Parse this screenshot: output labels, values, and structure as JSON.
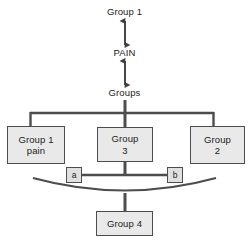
{
  "diagram": {
    "type": "hierarchy-flow-diagram",
    "colors": {
      "background": "#ffffff",
      "box_fill": "#e9e9e9",
      "small_box_fill": "#e0e0e0",
      "border": "#4d4d4d",
      "line": "#4d4d4d",
      "text": "#1b1b1b"
    },
    "top_chain": [
      {
        "id": "group-1",
        "label": "Group 1"
      },
      {
        "id": "pain",
        "label": "PAIN"
      },
      {
        "id": "groups",
        "label": "Groups"
      }
    ],
    "connectors": {
      "group1_to_pain": "double-headed-vertical-arrow",
      "pain_to_groups": "double-headed-vertical-arrow",
      "groups_to_branch": "vertical-line",
      "branch": "horizontal-bracket-three-way",
      "group3_to_ab": "vertical-line",
      "a_to_b": "horizontal-line",
      "arc_to_group4": "downward-arc",
      "arc_to_group4_stem": "vertical-line"
    },
    "branch_boxes": [
      {
        "id": "group-1-pain",
        "label": "Group 1\npain"
      },
      {
        "id": "group-3",
        "label": "Group\n3"
      },
      {
        "id": "group-2",
        "label": "Group\n2"
      }
    ],
    "marker_boxes": [
      {
        "id": "marker-a",
        "label": "a"
      },
      {
        "id": "marker-b",
        "label": "b"
      }
    ],
    "bottom_box": {
      "id": "group-4",
      "label": "Group 4"
    }
  }
}
